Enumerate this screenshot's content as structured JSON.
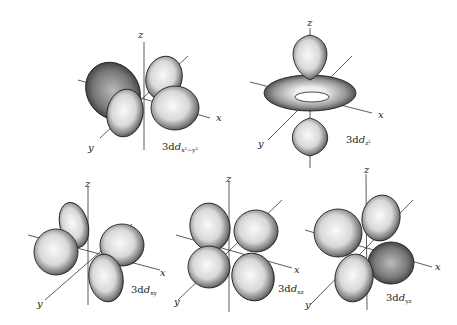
{
  "figure": {
    "panels": [
      {
        "id": "dx2y2",
        "label_main": "3d",
        "label_sub": "x²−y²",
        "axes": {
          "x": "x",
          "y": "y",
          "z": "z"
        }
      },
      {
        "id": "dz2",
        "label_main": "3d",
        "label_sub": "z²",
        "axes": {
          "x": "x",
          "y": "y",
          "z": "z"
        }
      },
      {
        "id": "dxy",
        "label_main": "3d",
        "label_sub": "xy",
        "axes": {
          "x": "x",
          "y": "y",
          "z": "z"
        }
      },
      {
        "id": "dxz",
        "label_main": "3d",
        "label_sub": "xz",
        "axes": {
          "x": "x",
          "y": "y",
          "z": "z"
        }
      },
      {
        "id": "dyz",
        "label_main": "3d",
        "label_sub": "yz",
        "axes": {
          "x": "x",
          "y": "y",
          "z": "z"
        }
      }
    ]
  }
}
